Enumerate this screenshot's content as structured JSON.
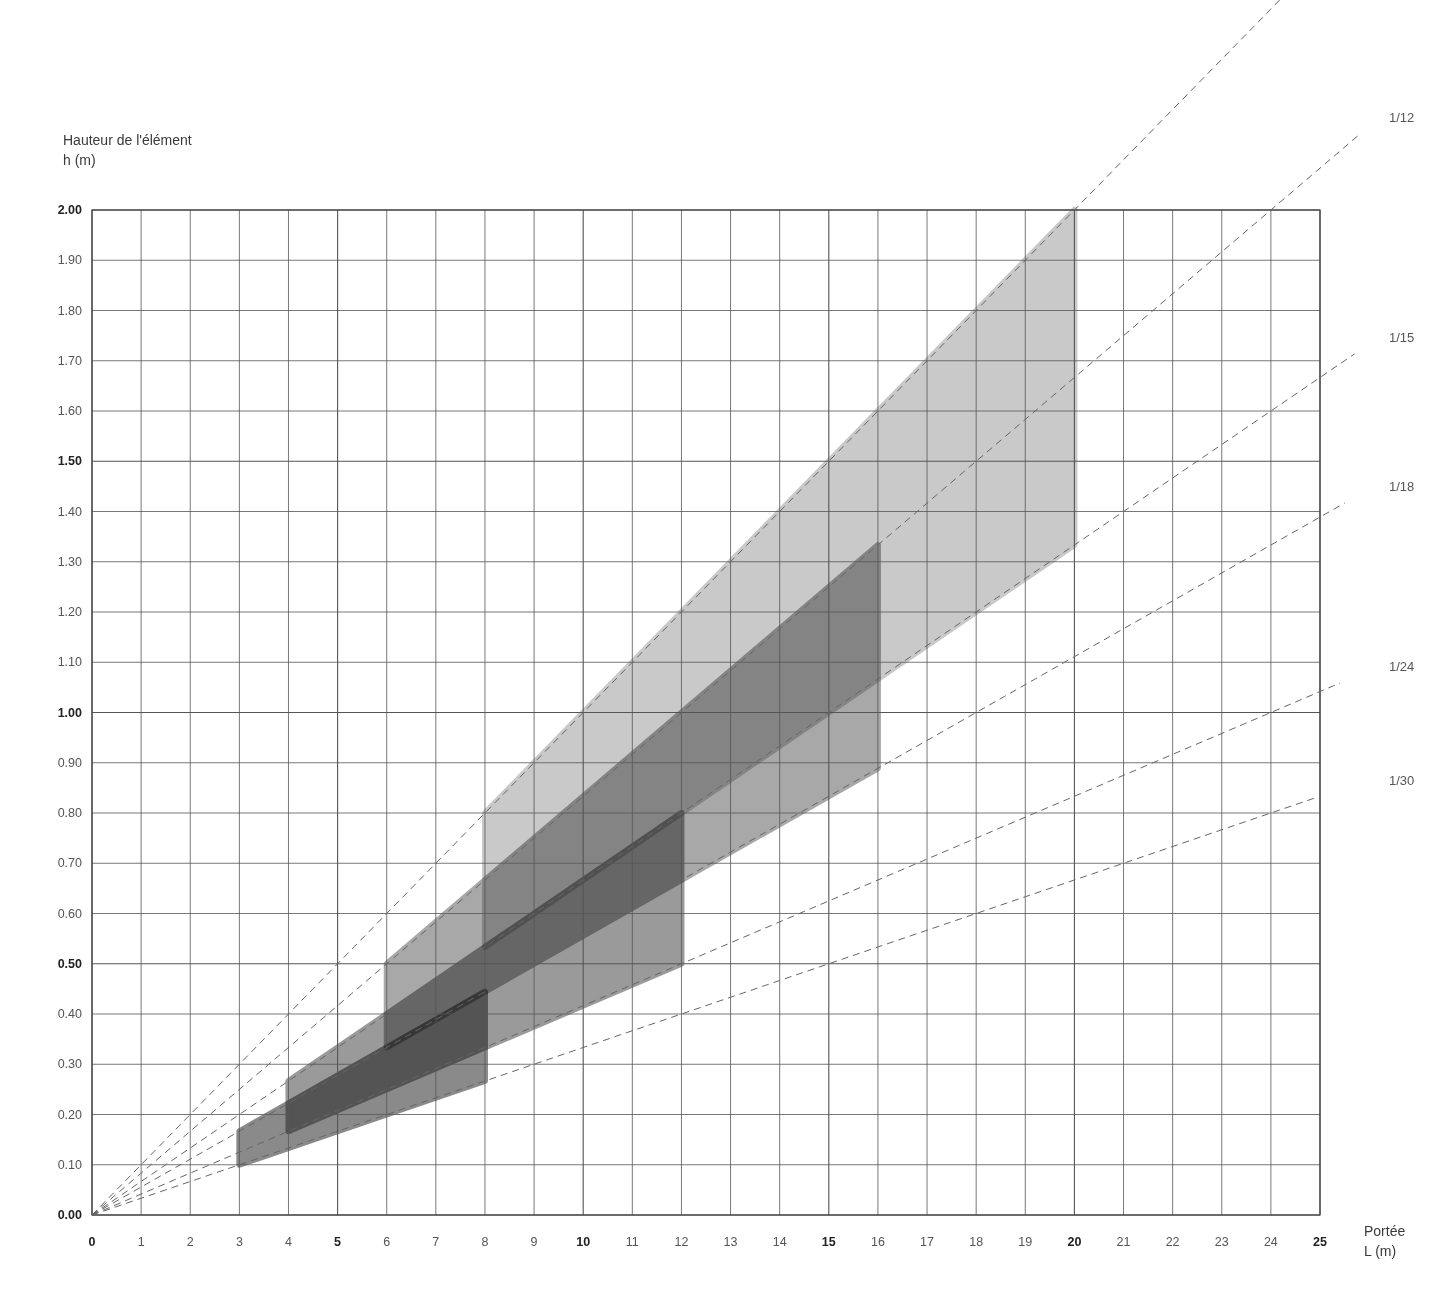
{
  "chart_data": {
    "type": "area",
    "title": "",
    "ylabel_line1": "Hauteur de l'élément",
    "ylabel_line2": "h (m)",
    "xlabel_line1": "Portée",
    "xlabel_line2": "L (m)",
    "xlim": [
      0,
      25
    ],
    "ylim": [
      0,
      2.0
    ],
    "grid": true,
    "x_ticks": [
      {
        "value": 0,
        "label": "0",
        "bold": true
      },
      {
        "value": 1,
        "label": "1",
        "bold": false
      },
      {
        "value": 2,
        "label": "2",
        "bold": false
      },
      {
        "value": 3,
        "label": "3",
        "bold": false
      },
      {
        "value": 4,
        "label": "4",
        "bold": false
      },
      {
        "value": 5,
        "label": "5",
        "bold": true
      },
      {
        "value": 6,
        "label": "6",
        "bold": false
      },
      {
        "value": 7,
        "label": "7",
        "bold": false
      },
      {
        "value": 8,
        "label": "8",
        "bold": false
      },
      {
        "value": 9,
        "label": "9",
        "bold": false
      },
      {
        "value": 10,
        "label": "10",
        "bold": true
      },
      {
        "value": 11,
        "label": "11",
        "bold": false
      },
      {
        "value": 12,
        "label": "12",
        "bold": false
      },
      {
        "value": 13,
        "label": "13",
        "bold": false
      },
      {
        "value": 14,
        "label": "14",
        "bold": false
      },
      {
        "value": 15,
        "label": "15",
        "bold": true
      },
      {
        "value": 16,
        "label": "16",
        "bold": false
      },
      {
        "value": 17,
        "label": "17",
        "bold": false
      },
      {
        "value": 18,
        "label": "18",
        "bold": false
      },
      {
        "value": 19,
        "label": "19",
        "bold": false
      },
      {
        "value": 20,
        "label": "20",
        "bold": true
      },
      {
        "value": 21,
        "label": "21",
        "bold": false
      },
      {
        "value": 22,
        "label": "22",
        "bold": false
      },
      {
        "value": 23,
        "label": "23",
        "bold": false
      },
      {
        "value": 24,
        "label": "24",
        "bold": false
      },
      {
        "value": 25,
        "label": "25",
        "bold": true
      }
    ],
    "y_ticks": [
      {
        "value": 0.0,
        "label": "0.00",
        "bold": true
      },
      {
        "value": 0.1,
        "label": "0.10",
        "bold": false
      },
      {
        "value": 0.2,
        "label": "0.20",
        "bold": false
      },
      {
        "value": 0.3,
        "label": "0.30",
        "bold": false
      },
      {
        "value": 0.4,
        "label": "0.40",
        "bold": false
      },
      {
        "value": 0.5,
        "label": "0.50",
        "bold": true
      },
      {
        "value": 0.6,
        "label": "0.60",
        "bold": false
      },
      {
        "value": 0.7,
        "label": "0.70",
        "bold": false
      },
      {
        "value": 0.8,
        "label": "0.80",
        "bold": false
      },
      {
        "value": 0.9,
        "label": "0.90",
        "bold": false
      },
      {
        "value": 1.0,
        "label": "1.00",
        "bold": true
      },
      {
        "value": 1.1,
        "label": "1.10",
        "bold": false
      },
      {
        "value": 1.2,
        "label": "1.20",
        "bold": false
      },
      {
        "value": 1.3,
        "label": "1.30",
        "bold": false
      },
      {
        "value": 1.4,
        "label": "1.40",
        "bold": false
      },
      {
        "value": 1.5,
        "label": "1.50",
        "bold": true
      },
      {
        "value": 1.6,
        "label": "1.60",
        "bold": false
      },
      {
        "value": 1.7,
        "label": "1.70",
        "bold": false
      },
      {
        "value": 1.8,
        "label": "1.80",
        "bold": false
      },
      {
        "value": 1.9,
        "label": "1.90",
        "bold": false
      },
      {
        "value": 2.0,
        "label": "2.00",
        "bold": true
      }
    ],
    "ratio_lines": [
      {
        "ratio": 10,
        "label": ""
      },
      {
        "ratio": 12,
        "label": "1/12"
      },
      {
        "ratio": 15,
        "label": "1/15"
      },
      {
        "ratio": 18,
        "label": "1/18"
      },
      {
        "ratio": 24,
        "label": "1/24"
      },
      {
        "ratio": 30,
        "label": "1/30"
      }
    ],
    "regions": [
      {
        "name": "light",
        "span_min": 8,
        "span_max": 20,
        "upper_ratio": 10,
        "lower_ratio": 15,
        "color": "#c9c9c9"
      },
      {
        "name": "medium",
        "span_min": 6,
        "span_max": 16,
        "upper_ratio": 12,
        "lower_ratio": 18,
        "color": "#a8a8a8"
      },
      {
        "name": "medium-dark",
        "span_min": 4,
        "span_max": 12,
        "upper_ratio": 15,
        "lower_ratio": 24,
        "color": "#9a9a9a"
      },
      {
        "name": "dark",
        "span_min": 3,
        "span_max": 8,
        "upper_ratio": 18,
        "lower_ratio": 30,
        "color": "#8a8a8a"
      }
    ]
  }
}
